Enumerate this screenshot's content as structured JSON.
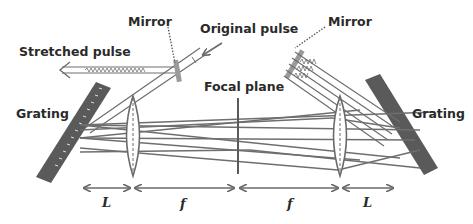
{
  "diagram": {
    "labels": {
      "mirror_left": "Mirror",
      "mirror_right": "Mirror",
      "original_pulse": "Original pulse",
      "stretched_pulse": "Stretched pulse",
      "focal_plane": "Focal plane",
      "grating_left": "Grating",
      "grating_right": "Grating"
    },
    "dimensions": [
      {
        "label": "L"
      },
      {
        "label": "f"
      },
      {
        "label": "f"
      },
      {
        "label": "L"
      }
    ],
    "colors": {
      "grating": "#5a5a5a",
      "rays": "#6e6e6e",
      "text": "#2a2a2a",
      "background": "#ffffff"
    }
  }
}
